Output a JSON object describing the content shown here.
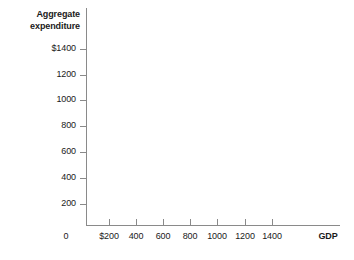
{
  "chart_data": {
    "type": "line",
    "title": "",
    "subtitle": "",
    "ylabel_line1": "Aggregate",
    "ylabel_line2": "expenditure",
    "xlabel": "GDP",
    "origin_label": "0",
    "grid": false,
    "legend": null,
    "annotations": [],
    "xlim": [
      0,
      1600
    ],
    "ylim": [
      0,
      1600
    ],
    "x_ticks": [
      {
        "value": 200,
        "label": "$200"
      },
      {
        "value": 400,
        "label": "400"
      },
      {
        "value": 600,
        "label": "600"
      },
      {
        "value": 800,
        "label": "800"
      },
      {
        "value": 1000,
        "label": "1000"
      },
      {
        "value": 1200,
        "label": "1200"
      },
      {
        "value": 1400,
        "label": "1400"
      }
    ],
    "y_ticks": [
      {
        "value": 1400,
        "label": "$1400"
      },
      {
        "value": 1200,
        "label": "1200"
      },
      {
        "value": 1000,
        "label": "1000"
      },
      {
        "value": 800,
        "label": "800"
      },
      {
        "value": 600,
        "label": "600"
      },
      {
        "value": 400,
        "label": "400"
      },
      {
        "value": 200,
        "label": "200"
      }
    ],
    "series": [],
    "values": [],
    "categories": [],
    "axis_color": "#8a8a8a",
    "text_color": "#1a1a1a",
    "background": "#ffffff"
  },
  "geometry": {
    "x_tick_px": [
      109,
      136,
      163,
      190,
      217,
      245,
      272
    ],
    "y_tick_px": [
      49,
      75,
      100,
      126,
      152,
      178,
      204
    ]
  }
}
